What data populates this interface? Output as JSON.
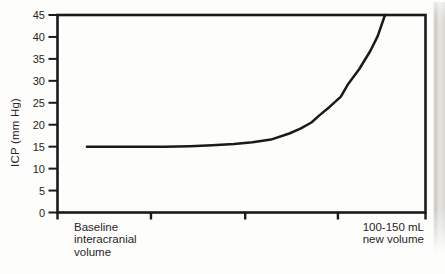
{
  "figure": {
    "background": "#fdfdfc",
    "text_color": "#262626",
    "axis_color": "#1a1a1a",
    "page_edge_strip": {
      "color_dark": "#c9c8c3",
      "color_light": "#e6e5e1"
    }
  },
  "chart_data": {
    "type": "line",
    "title": "",
    "ylabel": "ICP (mm Hg)",
    "xlabel_left": "Baseline\ninteracranial\nvolume",
    "xlabel_right": "100-150 mL\nnew volume",
    "ylim": [
      0,
      45
    ],
    "y_ticks": [
      0,
      5,
      10,
      15,
      20,
      25,
      30,
      35,
      40,
      45
    ],
    "x_ticks_unlabeled_fractions": [
      0,
      0.254,
      0.51,
      0.762,
      1
    ],
    "x_axis_numeric_labels": false,
    "grid": false,
    "legend_position": "none",
    "frame": "full-box",
    "line_color": "#1a1a1a",
    "series": [
      {
        "name": "ICP response to increasing intracranial volume",
        "x_fraction": [
          0.08,
          0.15,
          0.22,
          0.29,
          0.36,
          0.42,
          0.48,
          0.53,
          0.58,
          0.63,
          0.66,
          0.69,
          0.71,
          0.74,
          0.77,
          0.79,
          0.82,
          0.85,
          0.87,
          0.89
        ],
        "icp_mm_hg": [
          15,
          15,
          15,
          15,
          15.1,
          15.3,
          15.6,
          16,
          16.6,
          18,
          19.1,
          20.5,
          22,
          24.1,
          26.4,
          29.3,
          32.7,
          36.8,
          40.2,
          45
        ]
      }
    ]
  }
}
